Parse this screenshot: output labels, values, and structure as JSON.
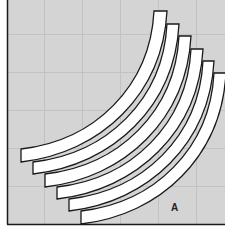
{
  "diagram": {
    "background_color": "#d4d4d4",
    "grid_color": "#c2c2c2",
    "strip_fill": "#ffffff",
    "stroke_color": "#1a1a1a",
    "label": "A",
    "strips": [
      {
        "left_x": 21,
        "left_top_y": 149,
        "left_bottom_y": 162,
        "top_left_x": 154,
        "top_right_x": 167,
        "top_y": 11
      },
      {
        "left_x": 33,
        "left_top_y": 162,
        "left_bottom_y": 174,
        "top_left_x": 167,
        "top_right_x": 179,
        "top_y": 24
      },
      {
        "left_x": 45,
        "left_top_y": 174,
        "left_bottom_y": 187,
        "top_left_x": 179,
        "top_right_x": 191,
        "top_y": 36
      },
      {
        "left_x": 57,
        "left_top_y": 187,
        "left_bottom_y": 199,
        "top_left_x": 191,
        "top_right_x": 203,
        "top_y": 49
      },
      {
        "left_x": 69,
        "left_top_y": 199,
        "left_bottom_y": 211,
        "top_left_x": 203,
        "top_right_x": 214,
        "top_y": 61
      },
      {
        "left_x": 81,
        "left_top_y": 211,
        "left_bottom_y": 224,
        "top_left_x": 214,
        "top_right_x": 226,
        "top_y": 73
      }
    ]
  }
}
